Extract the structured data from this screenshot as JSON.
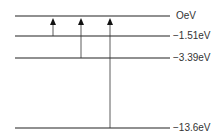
{
  "diagram": {
    "levels": [
      {
        "label": "OeV",
        "y": 16
      },
      {
        "label": "−1.51eV",
        "y": 36
      },
      {
        "label": "−3.39eV",
        "y": 58
      },
      {
        "label": "−13.6eV",
        "y": 128
      }
    ],
    "transitions": [
      {
        "from": "−1.51eV",
        "to": "OeV",
        "x": 53
      },
      {
        "from": "−3.39eV",
        "to": "OeV",
        "x": 81
      },
      {
        "from": "−13.6eV",
        "to": "OeV",
        "x": 110
      }
    ],
    "colors": {
      "line": "#222222",
      "text": "#333333"
    }
  }
}
